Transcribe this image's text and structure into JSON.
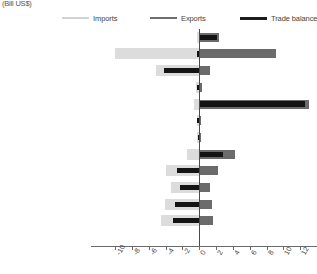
{
  "units_caption": "(Bill US$)",
  "legend": {
    "items": [
      {
        "label": "Imports",
        "color": "#dcdcdc",
        "key": "imports"
      },
      {
        "label": "Exports",
        "color": "#6b6b6b",
        "key": "exports"
      },
      {
        "label": "Trade balance",
        "color": "#141414",
        "key": "balance"
      }
    ]
  },
  "chart_data": {
    "type": "bar",
    "orientation": "horizontal",
    "title": "",
    "subtitle": "",
    "xlabel": "(Bill US$)",
    "ylabel": "",
    "xlim": [
      -10,
      14
    ],
    "xticks": [
      -10,
      -8,
      -6,
      -4,
      -2,
      0,
      2,
      4,
      6,
      8,
      10,
      12,
      14
    ],
    "xtick_labels": [
      "-10",
      "-8",
      "-6",
      "-4",
      "-2",
      "0",
      "2",
      "4",
      "6",
      "8",
      "10",
      "12",
      "14"
    ],
    "grid": false,
    "legend_position": "top",
    "zero_reference_line": true,
    "categories": [
      "Developed Asia-Pacific",
      "Developed Europe",
      "Developed N. America",
      "South-eastern Europe",
      "C I S",
      "Northern Africa",
      "Sub-Saharan Africa",
      "Latin Am, Caribbean",
      "Eastern Asia",
      "Southern Asia",
      "South-eastern Asia",
      "Western Asia",
      "Oceania"
    ],
    "series": [
      {
        "name": "Imports",
        "color": "#dcdcdc",
        "values": [
          -0.2,
          -10.0,
          -5.1,
          -0.4,
          -0.6,
          -0.3,
          -0.2,
          -1.4,
          -3.9,
          -3.3,
          -4.1,
          -4.5,
          0.0
        ]
      },
      {
        "name": "Exports",
        "color": "#6b6b6b",
        "values": [
          2.4,
          9.1,
          1.3,
          0.3,
          13.0,
          0.2,
          0.2,
          4.3,
          2.2,
          1.3,
          1.5,
          1.7,
          0.0
        ]
      },
      {
        "name": "Trade balance",
        "color": "#141414",
        "values": [
          2.1,
          -0.3,
          -4.2,
          -0.2,
          12.6,
          -0.2,
          -0.1,
          2.8,
          -2.6,
          -2.3,
          -2.9,
          -3.1,
          0.0
        ]
      }
    ]
  }
}
